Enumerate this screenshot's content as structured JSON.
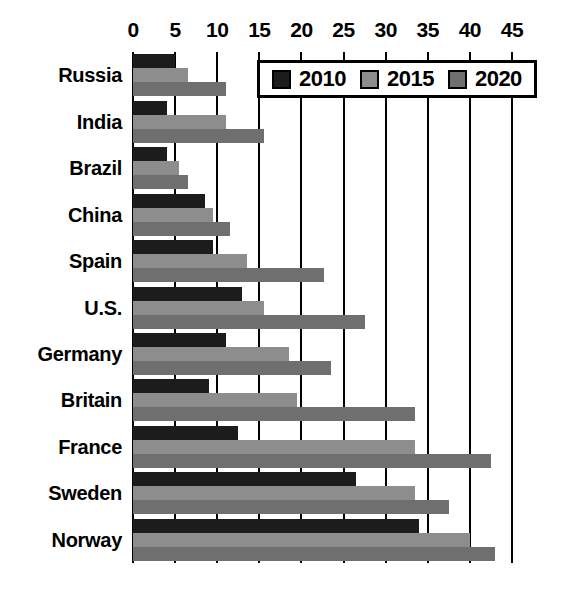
{
  "chart_data": {
    "type": "bar",
    "orientation": "horizontal",
    "title": "",
    "subtitle": "",
    "xlabel": "",
    "ylabel": "",
    "xlim": [
      0,
      45
    ],
    "ylim": null,
    "grid": true,
    "grid_axis": "x",
    "legend_position": "top-right",
    "xticks": [
      0,
      5,
      10,
      15,
      20,
      25,
      30,
      35,
      40,
      45
    ],
    "xtick_labels": [
      "0",
      "5",
      "10",
      "15",
      "20",
      "25",
      "30",
      "35",
      "40",
      "45"
    ],
    "categories": [
      "Russia",
      "India",
      "Brazil",
      "China",
      "Spain",
      "U.S.",
      "Germany",
      "Britain",
      "France",
      "Sweden",
      "Norway"
    ],
    "series": [
      {
        "name": "2010",
        "color": "#1c1c1c",
        "values": [
          5.0,
          4.0,
          4.0,
          8.5,
          9.5,
          13.0,
          11.0,
          9.0,
          12.5,
          26.5,
          34.0
        ]
      },
      {
        "name": "2015",
        "color": "#8d8d8d",
        "values": [
          6.5,
          11.0,
          5.5,
          9.5,
          13.5,
          15.5,
          18.5,
          19.5,
          33.5,
          33.5,
          40.0
        ]
      },
      {
        "name": "2020",
        "color": "#6f6f6f",
        "values": [
          11.0,
          15.5,
          6.5,
          11.5,
          22.7,
          27.5,
          23.5,
          33.5,
          42.5,
          37.5,
          43.0
        ]
      }
    ]
  },
  "legend": {
    "entries": [
      {
        "label": "2010",
        "swatch": "legend-swatch-2010"
      },
      {
        "label": "2015",
        "swatch": "legend-swatch-2015"
      },
      {
        "label": "2020",
        "swatch": "legend-swatch-2020"
      }
    ]
  },
  "colors": {
    "series_2010": "#1c1c1c",
    "series_2015": "#8d8d8d",
    "series_2020": "#6f6f6f",
    "axis": "#000000",
    "background": "#ffffff"
  }
}
